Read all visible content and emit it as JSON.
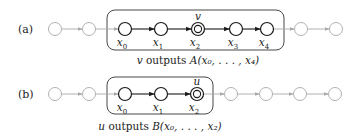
{
  "diagram": {
    "rows": [
      {
        "label": "(a)",
        "y": 29,
        "box": {
          "x": 107,
          "y": 10,
          "w": 177,
          "h": 40,
          "r": 8
        },
        "nodes": [
          {
            "x": 55,
            "type": "outside"
          },
          {
            "x": 89,
            "type": "outside"
          },
          {
            "x": 125,
            "type": "inside",
            "var": "x",
            "sub": "0"
          },
          {
            "x": 161,
            "type": "inside",
            "var": "x",
            "sub": "1"
          },
          {
            "x": 198,
            "type": "output",
            "var": "x",
            "sub": "2",
            "marker": "v"
          },
          {
            "x": 236,
            "type": "inside",
            "var": "x",
            "sub": "3"
          },
          {
            "x": 267,
            "type": "inside",
            "var": "x",
            "sub": "4"
          },
          {
            "x": 301,
            "type": "outside"
          },
          {
            "x": 336,
            "type": "outside"
          }
        ],
        "caption": {
          "var": "v",
          "text": " outputs ",
          "func": "A",
          "args": "(x₀, . . . , x₄)",
          "x": 198,
          "y": 64
        }
      },
      {
        "label": "(b)",
        "y": 94,
        "box": {
          "x": 107,
          "y": 77,
          "w": 106,
          "h": 37,
          "r": 8
        },
        "nodes": [
          {
            "x": 55,
            "type": "outside"
          },
          {
            "x": 89,
            "type": "outside"
          },
          {
            "x": 125,
            "type": "inside",
            "var": "x",
            "sub": "0"
          },
          {
            "x": 161,
            "type": "inside",
            "var": "x",
            "sub": "1"
          },
          {
            "x": 197,
            "type": "output",
            "var": "x",
            "sub": "2",
            "marker": "u"
          },
          {
            "x": 231,
            "type": "outside"
          },
          {
            "x": 266,
            "type": "outside"
          },
          {
            "x": 300,
            "type": "outside"
          },
          {
            "x": 335,
            "type": "outside"
          }
        ],
        "caption": {
          "var": "u",
          "text": " outputs ",
          "func": "B",
          "args": "(x₀, . . . , x₂)",
          "x": 160,
          "y": 130
        }
      }
    ],
    "colors": {
      "active": "#1a1a1a",
      "inactive": "#a8a8a8",
      "box": "#333333"
    }
  }
}
